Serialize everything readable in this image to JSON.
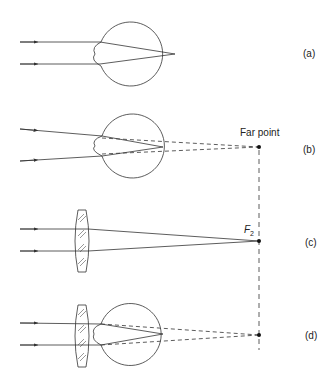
{
  "figure": {
    "panels": [
      {
        "id": "a",
        "label": "(a)",
        "description": "Myopic eye: parallel rays focus in front of retina"
      },
      {
        "id": "b",
        "label": "(b)",
        "annotation": "Far point"
      },
      {
        "id": "c",
        "label": "(c)",
        "annotation": "F",
        "annotation_sub": "2"
      },
      {
        "id": "d",
        "label": "(d)"
      }
    ],
    "colors": {
      "line": "#333333",
      "background": "#ffffff"
    }
  }
}
